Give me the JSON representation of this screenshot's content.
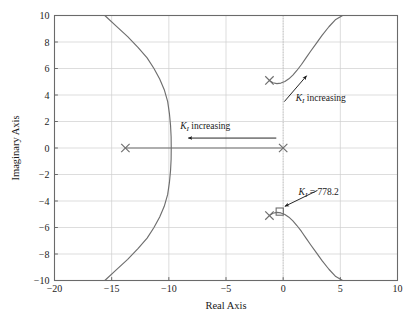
{
  "chart_data": {
    "type": "line",
    "title": "",
    "xlabel": "Real Axis",
    "ylabel": "Imaginary Axis",
    "xlim": [
      -20,
      10
    ],
    "ylim": [
      -10,
      10
    ],
    "xticks": [
      -20,
      -15,
      -10,
      -5,
      0,
      5,
      10
    ],
    "xtick_labels": [
      "−20",
      "−15",
      "−10",
      "−5",
      "0",
      "5",
      "10"
    ],
    "yticks": [
      -10,
      -8,
      -6,
      -4,
      -2,
      0,
      2,
      4,
      6,
      8,
      10
    ],
    "ytick_labels": [
      "−10",
      "−8",
      "−6",
      "−4",
      "−2",
      "0",
      "2",
      "4",
      "6",
      "8",
      "10"
    ],
    "grid": true,
    "legend": "none",
    "line_color": "#6e6e6e",
    "grid_color": "#cfcfcf",
    "axis_color": "#6a6a6a",
    "annotation_color": "#1a1a1a",
    "open_loop_poles": [
      {
        "name": "pole-real-far-left",
        "re": -13.8,
        "im": 0.0,
        "marker": "x"
      },
      {
        "name": "pole-origin",
        "re": 0.0,
        "im": 0.0,
        "marker": "x"
      },
      {
        "name": "pole-complex-upper",
        "re": -1.2,
        "im": 5.1,
        "marker": "x"
      },
      {
        "name": "pole-complex-lower",
        "re": -1.2,
        "im": -5.1,
        "marker": "x"
      }
    ],
    "gain_markers": [
      {
        "name": "gain-marker-778",
        "re": -0.3,
        "im": -4.8,
        "marker": "square",
        "label": "778.2"
      }
    ],
    "branches": [
      {
        "name": "left-real-branch",
        "points": [
          [
            -15.6,
            -10.0
          ],
          [
            -14.6,
            -9.2
          ],
          [
            -13.6,
            -8.4
          ],
          [
            -12.7,
            -7.6
          ],
          [
            -11.9,
            -6.8
          ],
          [
            -11.3,
            -6.0
          ],
          [
            -10.8,
            -5.2
          ],
          [
            -10.4,
            -4.4
          ],
          [
            -10.1,
            -3.5
          ],
          [
            -9.95,
            -2.6
          ],
          [
            -9.85,
            -1.7
          ],
          [
            -9.8,
            -0.85
          ],
          [
            -9.79,
            0.0
          ],
          [
            -9.8,
            0.85
          ],
          [
            -9.85,
            1.7
          ],
          [
            -9.95,
            2.6
          ],
          [
            -10.1,
            3.5
          ],
          [
            -10.4,
            4.4
          ],
          [
            -10.8,
            5.2
          ],
          [
            -11.3,
            6.0
          ],
          [
            -11.9,
            6.8
          ],
          [
            -12.7,
            7.6
          ],
          [
            -13.6,
            8.4
          ],
          [
            -14.6,
            9.2
          ],
          [
            -15.6,
            10.0
          ]
        ]
      },
      {
        "name": "real-axis-segment",
        "points": [
          [
            -13.8,
            0.0
          ],
          [
            0.0,
            0.0
          ]
        ]
      },
      {
        "name": "upper-complex-branch",
        "points": [
          [
            -1.2,
            5.1
          ],
          [
            -0.9,
            4.92
          ],
          [
            -0.55,
            4.86
          ],
          [
            -0.2,
            4.9
          ],
          [
            0.15,
            5.02
          ],
          [
            0.5,
            5.22
          ],
          [
            0.85,
            5.5
          ],
          [
            1.2,
            5.85
          ],
          [
            1.6,
            6.3
          ],
          [
            2.0,
            6.8
          ],
          [
            2.4,
            7.3
          ],
          [
            2.9,
            7.9
          ],
          [
            3.4,
            8.5
          ],
          [
            4.0,
            9.15
          ],
          [
            4.6,
            9.7
          ],
          [
            5.2,
            10.0
          ]
        ]
      },
      {
        "name": "lower-complex-branch",
        "points": [
          [
            -1.2,
            -5.1
          ],
          [
            -0.9,
            -4.92
          ],
          [
            -0.55,
            -4.86
          ],
          [
            -0.2,
            -4.9
          ],
          [
            0.15,
            -5.02
          ],
          [
            0.5,
            -5.22
          ],
          [
            0.85,
            -5.5
          ],
          [
            1.2,
            -5.85
          ],
          [
            1.6,
            -6.3
          ],
          [
            2.0,
            -6.8
          ],
          [
            2.4,
            -7.3
          ],
          [
            2.9,
            -7.9
          ],
          [
            3.4,
            -8.5
          ],
          [
            4.0,
            -9.15
          ],
          [
            4.6,
            -9.7
          ],
          [
            5.2,
            -10.0
          ],
          [
            5.6,
            -10.0
          ]
        ]
      }
    ],
    "annotations": [
      {
        "name": "ki-increasing-real",
        "symbol": "K",
        "subscript": "I",
        "text": " increasing",
        "text_x": -9.0,
        "text_y": 1.45,
        "arrow_from": [
          -0.6,
          0.75
        ],
        "arrow_to": [
          -8.3,
          0.75
        ]
      },
      {
        "name": "ki-increasing-complex",
        "symbol": "K",
        "subscript": "I",
        "text": " increasing",
        "text_x": 1.1,
        "text_y": 3.55,
        "arrow_from": [
          0.1,
          3.5
        ],
        "arrow_to": [
          2.05,
          5.45
        ]
      },
      {
        "name": "ki-value-callout",
        "symbol": "K",
        "subscript": "I",
        "text": " = 778.2",
        "text_x": 1.35,
        "text_y": -3.55,
        "arrow_from": [
          3.0,
          -3.2
        ],
        "arrow_to": [
          0.15,
          -4.4
        ]
      }
    ]
  }
}
